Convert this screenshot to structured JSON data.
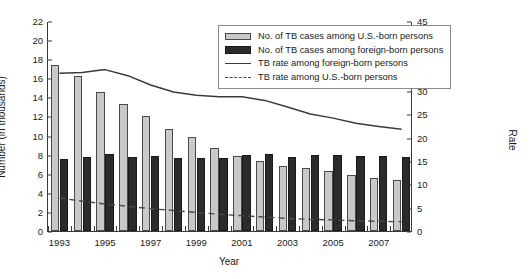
{
  "chart_data": {
    "type": "bar",
    "title": "",
    "xlabel": "Year",
    "ylabel": "Number (in thousands)",
    "y2label": "Rate",
    "ylim": [
      0,
      22
    ],
    "y2lim": [
      0,
      45
    ],
    "ytick_labels": [
      "0",
      "2",
      "4",
      "6",
      "8",
      "10",
      "12",
      "14",
      "16",
      "18",
      "20",
      "22"
    ],
    "ytick_values": [
      0,
      2,
      4,
      6,
      8,
      10,
      12,
      14,
      16,
      18,
      20,
      22
    ],
    "y2tick_labels": [
      "0",
      "5",
      "10",
      "15",
      "20",
      "25",
      "30",
      "35",
      "40",
      "45"
    ],
    "y2tick_values": [
      0,
      5,
      10,
      15,
      20,
      25,
      30,
      35,
      40,
      45
    ],
    "grid": false,
    "legend_position": "top-center",
    "categories": [
      1993,
      1994,
      1995,
      1996,
      1997,
      1998,
      1999,
      2000,
      2001,
      2002,
      2003,
      2004,
      2005,
      2006,
      2007,
      2008
    ],
    "xtick_labels": [
      "1993",
      "1995",
      "1997",
      "1999",
      "2001",
      "2003",
      "2005",
      "2007"
    ],
    "xtick_values": [
      1993,
      1995,
      1997,
      1999,
      2001,
      2003,
      2005,
      2007
    ],
    "series": [
      {
        "name": "No. of TB cases among U.S.-born persons",
        "type": "bar",
        "axis": "left",
        "color": "#c9c9c9",
        "values": [
          17.4,
          16.2,
          14.6,
          13.3,
          12.0,
          10.7,
          9.9,
          8.7,
          7.9,
          7.3,
          6.8,
          6.6,
          6.3,
          5.9,
          5.6,
          5.3
        ]
      },
      {
        "name": "No. of TB cases among foreign-born persons",
        "type": "bar",
        "axis": "left",
        "color": "#2b2b2b",
        "values": [
          7.5,
          7.8,
          8.1,
          7.8,
          7.9,
          7.6,
          7.6,
          7.6,
          8.0,
          8.1,
          7.8,
          8.0,
          8.0,
          7.9,
          7.9,
          7.8
        ]
      },
      {
        "name": "TB rate among foreign-born persons",
        "type": "line",
        "axis": "right",
        "color": "#3a3a3a",
        "style": "solid",
        "values": [
          34.0,
          34.2,
          34.8,
          33.5,
          31.5,
          30.0,
          29.3,
          29.0,
          29.0,
          28.2,
          26.8,
          25.3,
          24.4,
          23.3,
          22.6,
          22.0
        ]
      },
      {
        "name": "TB rate among U.S.-born persons",
        "type": "line",
        "axis": "right",
        "color": "#4a4a4a",
        "style": "dashed",
        "values": [
          7.3,
          6.6,
          6.0,
          5.5,
          5.0,
          4.6,
          4.2,
          3.8,
          3.5,
          3.2,
          2.9,
          2.7,
          2.6,
          2.4,
          2.3,
          2.2
        ]
      }
    ]
  },
  "legend": {
    "entries": [
      {
        "label": "No. of TB cases among U.S.-born persons",
        "swatch": "bar-light-swatch"
      },
      {
        "label": "No. of TB cases among foreign-born persons",
        "swatch": "bar-dark-swatch"
      },
      {
        "label": "TB rate among foreign-born persons",
        "swatch": "line-solid-swatch"
      },
      {
        "label": "TB rate among U.S.-born persons",
        "swatch": "line-dashed-swatch"
      }
    ]
  }
}
